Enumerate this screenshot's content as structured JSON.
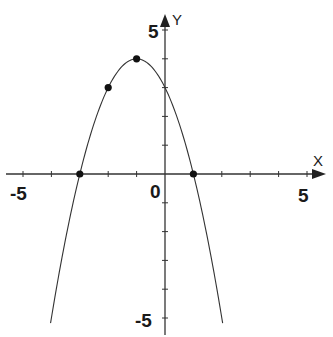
{
  "chart_data": {
    "type": "line",
    "title": "",
    "function": "y = -(x+1)^2 + 4",
    "xlabel": "X",
    "ylabel": "Y",
    "xlim": [
      -5,
      5
    ],
    "ylim": [
      -5,
      5
    ],
    "tick_step": 1,
    "tick_labels": {
      "x": [
        "-5",
        "0",
        "5"
      ],
      "y": [
        "5",
        "-5"
      ]
    },
    "grid": false,
    "curve": {
      "x_range": [
        -4,
        2
      ],
      "color": "#333333"
    },
    "points": [
      {
        "x": -3,
        "y": 0
      },
      {
        "x": -2,
        "y": 3
      },
      {
        "x": -1,
        "y": 4
      },
      {
        "x": 1,
        "y": 0
      }
    ]
  },
  "axes": {
    "x_label": "X",
    "y_label": "Y",
    "origin_label": "0",
    "x_min_label": "-5",
    "x_max_label": "5",
    "y_max_label": "5",
    "y_min_label": "-5"
  }
}
